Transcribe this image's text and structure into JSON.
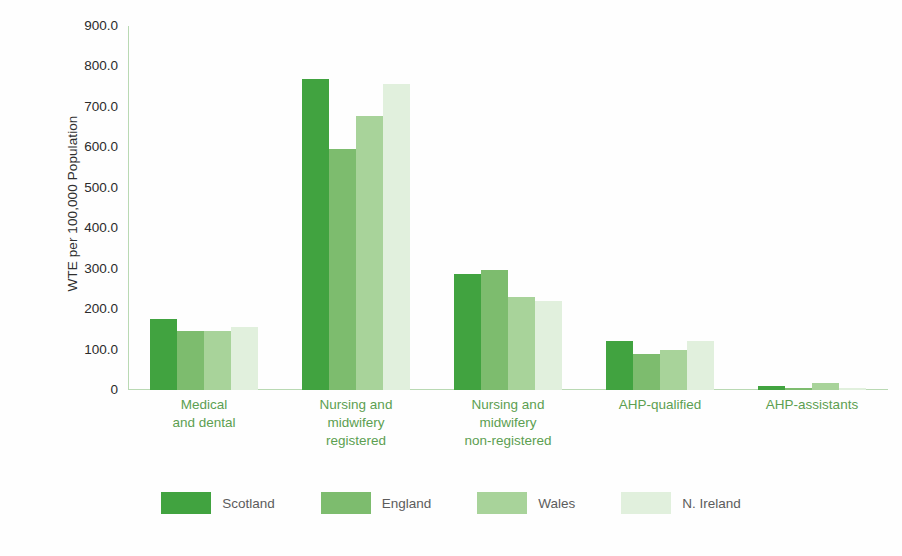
{
  "chart_data": {
    "type": "bar",
    "title": "",
    "subtitle": "",
    "xlabel": "",
    "ylabel": "WTE per 100,000 Population",
    "ylim": [
      0,
      900
    ],
    "yticks": [
      900.0,
      800.0,
      700.0,
      600.0,
      500.0,
      400.0,
      300.0,
      200.0,
      100.0,
      0
    ],
    "ytick_labels": [
      "900.0",
      "800.0",
      "700.0",
      "600.0",
      "500.0",
      "400.0",
      "300.0",
      "200.0",
      "100.0",
      "0"
    ],
    "grid": false,
    "legend_position": "bottom",
    "categories": [
      "Medical and dental",
      "Nursing and midwifery registered",
      "Nursing and midwifery non-registered",
      "AHP-qualified",
      "AHP-assistants"
    ],
    "category_lines": [
      [
        "Medical",
        "and dental"
      ],
      [
        "Nursing and",
        "midwifery",
        "registered"
      ],
      [
        "Nursing and",
        "midwifery",
        "non-registered"
      ],
      [
        "AHP-qualified"
      ],
      [
        "AHP-assistants"
      ]
    ],
    "series": [
      {
        "name": "Scotland",
        "color": "#41a340",
        "values": [
          176,
          768,
          287,
          120,
          10
        ]
      },
      {
        "name": "England",
        "color": "#7dbc6e",
        "values": [
          146,
          597,
          296,
          88,
          5
        ]
      },
      {
        "name": "Wales",
        "color": "#a8d39a",
        "values": [
          146,
          678,
          231,
          100,
          17
        ]
      },
      {
        "name": "N. Ireland",
        "color": "#e1f0dd",
        "values": [
          156,
          757,
          219,
          120,
          4
        ]
      }
    ]
  },
  "legend": {
    "entries": [
      {
        "label": "Scotland",
        "color": "#41a340"
      },
      {
        "label": "England",
        "color": "#7dbc6e"
      },
      {
        "label": "Wales",
        "color": "#a8d39a"
      },
      {
        "label": "N. Ireland",
        "color": "#e1f0dd"
      }
    ]
  },
  "colors": {
    "scotland": "#41a340",
    "england": "#7dbc6e",
    "wales": "#a8d39a",
    "n_ireland": "#e1f0dd",
    "axis": "#b9d9b3",
    "category_label": "#5c9f51",
    "tick_label": "#2b2b2b",
    "legend_label": "#5c5c5c",
    "background": "#fefefe"
  }
}
